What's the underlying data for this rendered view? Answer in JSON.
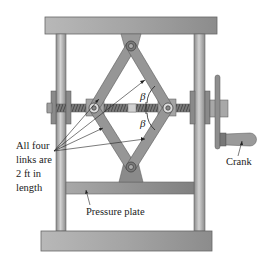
{
  "figure": {
    "type": "mechanical-diagram",
    "labels": {
      "links_note_line1": "All four",
      "links_note_line2": "links are",
      "links_note_line3": "2 ft in",
      "links_note_line4": "length",
      "pressure_plate": "Pressure plate",
      "crank": "Crank",
      "angle_upper": "β",
      "angle_lower": "β"
    },
    "colors": {
      "frame": "#9a9a9a",
      "frame_light": "#c4c4c4",
      "link": "#8e8e8e",
      "screw": "#6e6e6e",
      "text": "#222222",
      "background": "#ffffff"
    },
    "link_length": "2 ft",
    "link_count": 4
  }
}
